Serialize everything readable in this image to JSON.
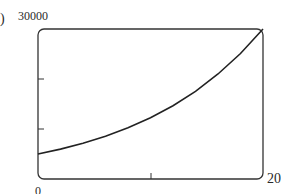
{
  "panel_label": ")",
  "chart_data": {
    "type": "line",
    "title": "",
    "xlabel": "",
    "ylabel": "",
    "xlim": [
      0,
      20
    ],
    "ylim": [
      0,
      30000
    ],
    "x_tick_labels": [
      "0",
      "20"
    ],
    "y_tick_labels": [
      "30000"
    ],
    "x_ticks": [
      10
    ],
    "y_ticks": [
      10000,
      20000
    ],
    "grid": false,
    "series": [
      {
        "name": "curve",
        "x": [
          0,
          2,
          4,
          6,
          8,
          10,
          12,
          14,
          16,
          18,
          20
        ],
        "values": [
          5000,
          5980,
          7160,
          8570,
          10250,
          12250,
          14670,
          17550,
          21000,
          25100,
          30000
        ]
      }
    ]
  },
  "labels": {
    "ymax": "30000",
    "xmin": "0",
    "xmax": "20"
  }
}
